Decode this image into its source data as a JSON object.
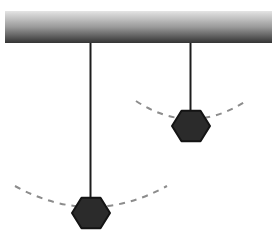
{
  "figure": {
    "width": 278,
    "height": 237,
    "background_color": "#ffffff"
  },
  "ceiling": {
    "label": "ceiling-support-bar",
    "x": 5,
    "y": 11,
    "width": 267,
    "height": 32,
    "gradient_top_color": "#e4e4e4",
    "gradient_mid_color": "#9a9a9a",
    "gradient_bottom_color": "#343434"
  },
  "pendulums": [
    {
      "id": "left-pendulum",
      "label": "Long pendulum",
      "pivot_x": 90.5,
      "pivot_y": 43,
      "string_length": 157,
      "string_color": "#1c1c1c",
      "string_width": 2,
      "bob": {
        "label": "hexagonal-bob",
        "center_x": 91,
        "center_y": 213,
        "radius_x": 19,
        "radius_y": 17.5,
        "fill_color": "#2b2b2b",
        "stroke_color": "#141414",
        "sides": 6,
        "orientation": "flat-top"
      },
      "arc": {
        "label": "swing-path",
        "start_x": 15,
        "start_y": 186,
        "control_x": 91,
        "control_y": 228,
        "end_x": 167,
        "end_y": 186,
        "color": "#8c8c8c",
        "width": 2,
        "dash": "6 6"
      }
    },
    {
      "id": "right-pendulum",
      "label": "Short pendulum",
      "pivot_x": 190.5,
      "pivot_y": 43,
      "string_length": 70,
      "string_color": "#1c1c1c",
      "string_width": 2,
      "bob": {
        "label": "hexagonal-bob",
        "center_x": 191,
        "center_y": 126,
        "radius_x": 19,
        "radius_y": 17.5,
        "fill_color": "#2b2b2b",
        "stroke_color": "#141414",
        "sides": 6,
        "orientation": "flat-top"
      },
      "arc": {
        "label": "swing-path",
        "start_x": 136,
        "start_y": 101,
        "control_x": 191,
        "control_y": 137,
        "end_x": 246,
        "end_y": 101,
        "color": "#8c8c8c",
        "width": 2,
        "dash": "6 6"
      }
    }
  ]
}
